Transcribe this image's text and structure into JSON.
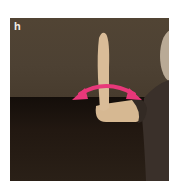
{
  "figure": {
    "panel_label": "h",
    "colors": {
      "wall": "#4d4132",
      "table": "#1e1610",
      "skin": "#d8b994",
      "shirt": "#3a302a",
      "arrow": "#e8387a",
      "frame_bg": "#ffffff"
    },
    "icons": {
      "arrow": "double-headed-curved-arrow"
    }
  }
}
